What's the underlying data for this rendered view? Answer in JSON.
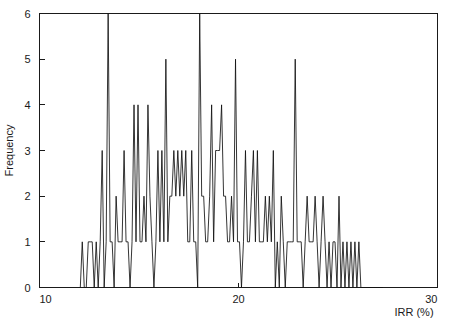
{
  "chart_data": {
    "type": "line",
    "title": "",
    "subtitle": "",
    "xlabel": "IRR (%)",
    "ylabel": "Frequency",
    "xlim": [
      10,
      30
    ],
    "ylim": [
      0,
      6
    ],
    "xticks": [
      10,
      20,
      30
    ],
    "xticklabels": [
      "10",
      "20",
      "30"
    ],
    "yticks": [
      0,
      1,
      2,
      3,
      4,
      5,
      6
    ],
    "yticklabels": [
      "0",
      "1",
      "2",
      "3",
      "4",
      "5",
      "6"
    ],
    "grid": false,
    "legend": null,
    "annotations": [],
    "series": [
      {
        "name": "IRR frequency polygon",
        "color": "#111111",
        "x": [
          12.05,
          12.15,
          12.25,
          12.35,
          12.45,
          12.55,
          12.65,
          12.75,
          12.85,
          12.95,
          13.05,
          13.15,
          13.25,
          13.35,
          13.45,
          13.55,
          13.65,
          13.75,
          13.85,
          13.95,
          14.05,
          14.15,
          14.25,
          14.35,
          14.45,
          14.55,
          14.65,
          14.75,
          14.85,
          14.95,
          15.05,
          15.15,
          15.25,
          15.35,
          15.45,
          15.55,
          15.65,
          15.75,
          15.85,
          15.95,
          16.05,
          16.15,
          16.25,
          16.35,
          16.45,
          16.55,
          16.65,
          16.75,
          16.85,
          16.95,
          17.05,
          17.15,
          17.25,
          17.35,
          17.45,
          17.55,
          17.65,
          17.75,
          17.85,
          17.95,
          18.05,
          18.15,
          18.25,
          18.35,
          18.45,
          18.55,
          18.65,
          18.75,
          18.85,
          18.95,
          19.05,
          19.15,
          19.25,
          19.35,
          19.45,
          19.55,
          19.65,
          19.75,
          19.85,
          19.95,
          20.05,
          20.15,
          20.25,
          20.35,
          20.45,
          20.55,
          20.65,
          20.75,
          20.85,
          20.95,
          21.05,
          21.15,
          21.25,
          21.35,
          21.45,
          21.55,
          21.65,
          21.75,
          21.85,
          21.95,
          22.05,
          22.15,
          22.25,
          22.35,
          22.45,
          22.55,
          22.65,
          22.75,
          22.85,
          22.95,
          23.05,
          23.15,
          23.25,
          23.35,
          23.45,
          23.55,
          23.65,
          23.75,
          23.85,
          23.95,
          24.05,
          24.15,
          24.25,
          24.35,
          24.45,
          24.55,
          24.65,
          24.75,
          24.85,
          24.95,
          25.05,
          25.15,
          25.25,
          25.35,
          25.45,
          25.55,
          25.65,
          25.75,
          25.85,
          25.95,
          26.05,
          26.15,
          26.25,
          26.35,
          26.45,
          26.55,
          26.65,
          26.75,
          26.85,
          26.95,
          27.05,
          27.15,
          27.25
        ],
        "values": [
          0,
          1,
          0,
          0,
          1,
          1,
          1,
          0,
          1,
          0,
          1,
          3,
          0,
          1,
          6,
          1,
          1,
          0,
          2,
          1,
          1,
          1,
          3,
          1,
          1,
          0,
          1,
          4,
          1,
          4,
          1,
          1,
          2,
          1,
          4,
          2,
          1,
          0,
          1,
          3,
          1,
          3,
          1,
          5,
          1,
          2,
          2,
          3,
          2,
          3,
          2,
          3,
          2,
          3,
          1,
          1,
          3,
          1,
          1,
          0,
          6,
          2,
          2,
          1,
          1,
          2,
          4,
          1,
          3,
          3,
          3,
          4,
          2,
          2,
          1,
          1,
          2,
          1,
          5,
          1,
          1,
          0,
          1,
          3,
          1,
          1,
          2,
          3,
          1,
          3,
          1,
          1,
          1,
          2,
          1,
          2,
          1,
          3,
          0,
          1,
          0,
          2,
          1,
          0,
          1,
          1,
          1,
          1,
          5,
          1,
          1,
          1,
          0,
          1,
          2,
          1,
          1,
          1,
          2,
          1,
          0,
          1,
          2,
          1,
          0,
          1,
          0,
          1,
          1,
          0,
          2,
          0,
          1,
          0,
          1,
          0,
          1,
          0,
          1,
          0,
          1,
          0,
          0,
          0,
          0,
          0,
          0,
          0,
          0,
          0,
          0,
          0,
          0
        ]
      }
    ]
  },
  "axes": {
    "y_title": "Frequency",
    "x_title": "IRR (%)"
  }
}
